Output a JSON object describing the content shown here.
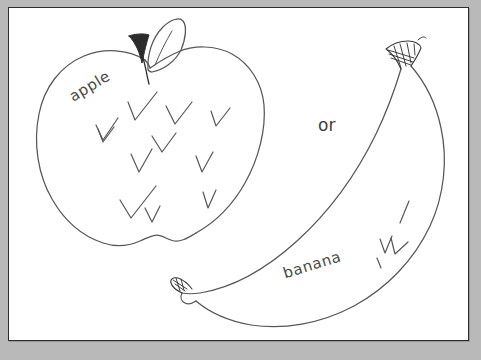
{
  "canvas": {
    "background_color": "#ffffff",
    "frame_color": "#b9b9b9",
    "border_color": "#2e2e2e"
  },
  "drawing": {
    "medium": "pencil-sketch",
    "ink_color": "#555555",
    "dark_ink_color": "#2b2b2b",
    "title": "",
    "objects": [
      {
        "name": "apple",
        "label": "apple",
        "label_rotation_deg": -31,
        "has_stem": true,
        "has_leaf": true,
        "shading_marks": 11
      },
      {
        "name": "banana",
        "label": "banana",
        "label_rotation_deg": -17,
        "has_stem": true,
        "has_leaf": false,
        "shading_marks": 4
      }
    ],
    "connector_label": "or"
  },
  "labels": {
    "apple": "apple",
    "banana": "banana",
    "or": "or"
  }
}
